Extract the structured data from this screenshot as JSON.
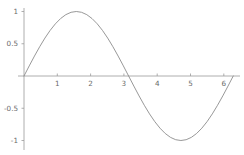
{
  "chart_data": {
    "type": "line",
    "title": "",
    "subtitle": "",
    "xlabel": "",
    "ylabel": "",
    "function": "sin(x)",
    "xlim": [
      -0.1,
      6.6
    ],
    "ylim": [
      -1.1,
      1.1
    ],
    "grid": false,
    "legend": null,
    "axis_style": "centered-cross",
    "line_color": "#8c8c8c",
    "axis_color": "#9a9a9a",
    "label_color": "#6b6b6b",
    "background_color": "#ffffff",
    "x_ticks": [
      1,
      2,
      3,
      4,
      5,
      6
    ],
    "x_tick_labels": [
      "1",
      "2",
      "3",
      "4",
      "5",
      "6"
    ],
    "y_ticks": [
      1,
      0.5,
      -0.5,
      -1
    ],
    "y_tick_labels": [
      "1",
      "0.5",
      "-0.5",
      "-1"
    ],
    "x": [
      0,
      0.1571,
      0.3142,
      0.4712,
      0.6283,
      0.7854,
      0.9425,
      1.0996,
      1.2566,
      1.4137,
      1.5708,
      1.7279,
      1.885,
      2.042,
      2.1991,
      2.3562,
      2.5133,
      2.6704,
      2.8274,
      2.9845,
      3.1416,
      3.2987,
      3.4558,
      3.6128,
      3.7699,
      3.927,
      4.0841,
      4.2412,
      4.3982,
      4.5553,
      4.7124,
      4.8695,
      5.0265,
      5.1836,
      5.3407,
      5.4978,
      5.6549,
      5.8119,
      5.969,
      6.1261,
      6.2832
    ],
    "y": [
      0,
      0.1564,
      0.309,
      0.454,
      0.5878,
      0.7071,
      0.809,
      0.891,
      0.9511,
      0.9877,
      1,
      0.9877,
      0.9511,
      0.891,
      0.809,
      0.7071,
      0.5878,
      0.454,
      0.309,
      0.1564,
      0,
      -0.1564,
      -0.309,
      -0.454,
      -0.5878,
      -0.7071,
      -0.809,
      -0.891,
      -0.9511,
      -0.9877,
      -1,
      -0.9877,
      -0.9511,
      -0.891,
      -0.809,
      -0.7071,
      -0.5878,
      -0.454,
      -0.309,
      -0.1564,
      0
    ],
    "annotations": [],
    "key_points": {
      "maximum": {
        "x": 1.5708,
        "y": 1
      },
      "minimum": {
        "x": 4.7124,
        "y": -1
      },
      "zero_crossings": [
        0,
        3.1416,
        6.2832
      ]
    }
  },
  "geometry": {
    "origin_x": 24,
    "origin_y": 76,
    "x_scale": 33.3,
    "y_scale": 64.5,
    "x_axis_start": 18,
    "x_axis_end": 240,
    "y_axis_top": 8,
    "y_axis_bottom": 150
  }
}
